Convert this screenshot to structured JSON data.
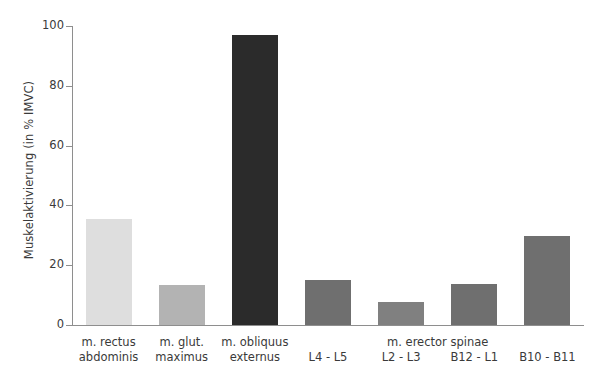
{
  "chart_data": {
    "type": "bar",
    "title": "",
    "subtitle": "",
    "xlabel": "",
    "ylabel": "Muskelaktivierung (in % IMVC)",
    "ylim": [
      0,
      100
    ],
    "yticks": [
      0,
      20,
      40,
      60,
      80,
      100
    ],
    "ytick_labels": [
      "0",
      "20",
      "40",
      "60",
      "80",
      "100"
    ],
    "grid": false,
    "legend": null,
    "categories": [
      "m. rectus abdominis",
      "m. glut. maximus",
      "m. obliquus externus",
      "L4 - L5",
      "L2 - L3",
      "B12 - L1",
      "B10 - B11"
    ],
    "values": [
      35.4,
      13.3,
      97.0,
      15.0,
      7.7,
      13.7,
      29.7
    ],
    "bar_colors": [
      "#dedede",
      "#b3b3b3",
      "#2b2b2b",
      "#6f6f6f",
      "#808080",
      "#6f6f6f",
      "#6f6f6f"
    ],
    "group_annotations": [
      {
        "label": "m. erector spinae",
        "spans_categories": [
          "L4 - L5",
          "L2 - L3",
          "B12 - L1",
          "B10 - B11"
        ]
      }
    ]
  },
  "axis": {
    "y_title": "Muskelaktivierung (in % IMVC)",
    "y_ticks": [
      {
        "label": "100",
        "value": 100
      },
      {
        "label": "80",
        "value": 80
      },
      {
        "label": "60",
        "value": 60
      },
      {
        "label": "40",
        "value": 40
      },
      {
        "label": "20",
        "value": 20
      },
      {
        "label": "0",
        "value": 0
      }
    ]
  },
  "x_labels": [
    {
      "line1": "m. rectus",
      "line2": "abdominis"
    },
    {
      "line1": "m. glut.",
      "line2": "maximus"
    },
    {
      "line1": "m. obliquus",
      "line2": "externus"
    },
    {
      "line1": "L4 - L5",
      "line2": ""
    },
    {
      "line1": "L2 - L3",
      "line2": ""
    },
    {
      "line1": "B12 - L1",
      "line2": ""
    },
    {
      "line1": "B10 - B11",
      "line2": ""
    }
  ],
  "group_label": "m. erector spinae",
  "colors": {
    "axis": "#8e8e8e",
    "text": "#3a3a3a",
    "background": "#ffffff"
  }
}
